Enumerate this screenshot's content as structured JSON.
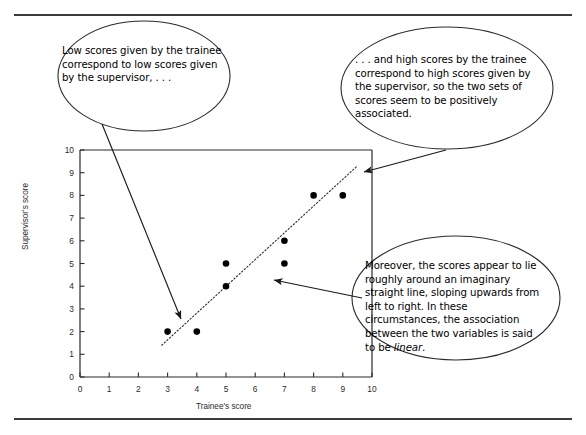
{
  "figure": {
    "kind": "annotated-scatterplot-figure",
    "rules": [
      "top-rule",
      "bottom-rule"
    ]
  },
  "callouts": [
    {
      "id": "callout-1",
      "name": "callout-low-scores",
      "text": "Low scores given by the trainee correspond to low scores given by the supervisor, . . ."
    },
    {
      "id": "callout-2",
      "name": "callout-high-scores",
      "text": ". . . and high scores by the trainee correspond to high scores given by the supervisor, so the two sets of scores seem to be positively associated."
    },
    {
      "id": "callout-3",
      "name": "callout-linear-association",
      "text_before": "Moreover, the scores appear to lie roughly around an imaginary straight line, sloping upwards from left to right. In these circumstances, the association between the two variables is said to be ",
      "emphasis": "linear",
      "text_after": "."
    }
  ],
  "chart_data": {
    "type": "scatter",
    "title": "",
    "xlabel": "Trainee's score",
    "ylabel": "Supervisor's score",
    "xlim": [
      0,
      10
    ],
    "ylim": [
      0,
      10
    ],
    "xticks": [
      0,
      1,
      2,
      3,
      4,
      5,
      6,
      7,
      8,
      9,
      10
    ],
    "yticks": [
      0,
      1,
      2,
      3,
      4,
      5,
      6,
      7,
      8,
      9,
      10
    ],
    "grid": false,
    "legend": null,
    "marker": "filled-circle",
    "marker_color": "#000000",
    "points": [
      {
        "x": 3,
        "y": 2
      },
      {
        "x": 4,
        "y": 2
      },
      {
        "x": 5,
        "y": 4
      },
      {
        "x": 5,
        "y": 5
      },
      {
        "x": 7,
        "y": 5
      },
      {
        "x": 7,
        "y": 6
      },
      {
        "x": 8,
        "y": 8
      },
      {
        "x": 9,
        "y": 8
      }
    ],
    "trend_line": {
      "style": "dotted",
      "label": "imaginary straight line",
      "from": {
        "x": 2.8,
        "y": 1.4
      },
      "to": {
        "x": 9.5,
        "y": 9.3
      }
    }
  },
  "annotations": {
    "arrows": [
      {
        "name": "arrow-to-low-scores",
        "from_callout": "callout-1",
        "to": {
          "x": 3.5,
          "y": 2.45
        }
      },
      {
        "name": "arrow-to-high-scores",
        "from_callout": "callout-2",
        "to": {
          "x": 9.5,
          "y": 9.15
        }
      },
      {
        "name": "arrow-to-trend-line",
        "from_callout": "callout-3",
        "to": {
          "x": 6.45,
          "y": 4.45
        }
      }
    ]
  }
}
